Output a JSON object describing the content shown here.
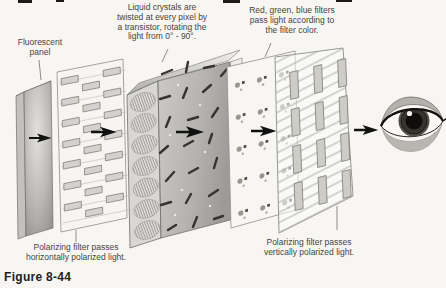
{
  "figure": {
    "caption": "Figure 8-44"
  },
  "labels": {
    "fluorescent_panel": {
      "lines": [
        "Fluorescent",
        "panel"
      ]
    },
    "liquid_crystals": {
      "lines": [
        "Liquid crystals are",
        "twisted at every pixel by",
        "a transistor, rotating the",
        "light from 0° - 90°."
      ]
    },
    "rgb_filters": {
      "lines": [
        "Red, green, blue filters",
        "pass light according to",
        "the filter color."
      ]
    },
    "horizontal_polarizer": {
      "lines": [
        "Polarizing filter passes",
        "horizontally polarized light."
      ]
    },
    "vertical_polarizer": {
      "lines": [
        "Polarizing filter passes",
        "vertically polarized light."
      ]
    }
  },
  "diagram": {
    "components": [
      "fluorescent-panel",
      "horizontal-polarizing-filter",
      "liquid-crystal-layer",
      "color-filter-panel",
      "vertical-polarizing-filter",
      "eye"
    ],
    "light_direction": "left-to-right",
    "arrow_count": 5
  },
  "colors": {
    "background": "#f7f6f3",
    "panel_white": "#f6f5f2",
    "panel_gray": "#b5b4b0",
    "slot_gray": "#d3d2ce",
    "text": "#46453f",
    "arrow": "#111111",
    "leader_line": "#8e8d89"
  }
}
